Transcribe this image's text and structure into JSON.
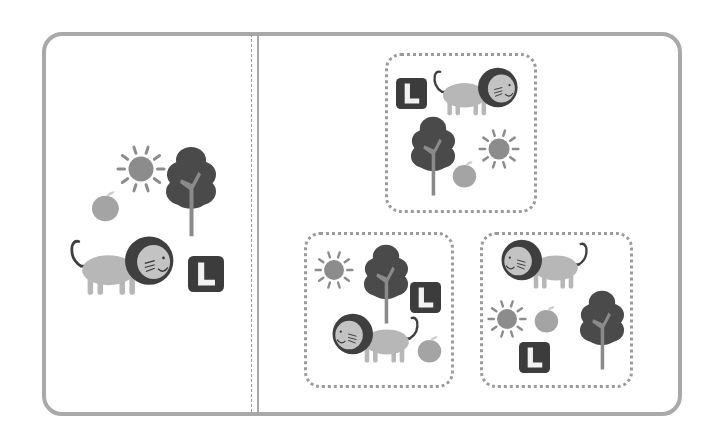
{
  "puzzle": {
    "type": "picture-matching",
    "colors": {
      "frame": "#a9a9a9",
      "dotted_border": "#9b9b9b",
      "lion_body": "#b7b7b7",
      "lion_mane": "#3f3f3f",
      "lion_face": "#c3c3c3",
      "tree_foliage": "#4a4a4a",
      "tree_trunk": "#8a8a8a",
      "sun": "#8c8c8c",
      "apple": "#a4a4a4",
      "letter_tile": "#3c3c3c",
      "letter_fill": "#f2f2f2"
    },
    "reference_panel": {
      "items": [
        {
          "kind": "sun",
          "x": 116,
          "y": 144,
          "size": 50
        },
        {
          "kind": "tree",
          "x": 166,
          "y": 146,
          "size": 50
        },
        {
          "kind": "apple",
          "x": 90,
          "y": 190,
          "size": 32
        },
        {
          "kind": "lion",
          "x": 70,
          "y": 232,
          "size": 110,
          "facing": "right"
        },
        {
          "kind": "letter-tile",
          "x": 188,
          "y": 256,
          "size": 36,
          "letter": "L"
        }
      ]
    },
    "options": [
      {
        "id": "top",
        "box": {
          "x": 385,
          "y": 53,
          "w": 152,
          "h": 160
        },
        "items": [
          {
            "kind": "letter-tile",
            "x": 396,
            "y": 78,
            "size": 31,
            "letter": "L"
          },
          {
            "kind": "lion",
            "x": 433,
            "y": 64,
            "size": 90,
            "facing": "right"
          },
          {
            "kind": "tree",
            "x": 411,
            "y": 116,
            "size": 44
          },
          {
            "kind": "sun",
            "x": 478,
            "y": 128,
            "size": 42
          },
          {
            "kind": "apple",
            "x": 451,
            "y": 160,
            "size": 28
          }
        ]
      },
      {
        "id": "bottom-left",
        "box": {
          "x": 304,
          "y": 232,
          "w": 150,
          "h": 156
        },
        "items": [
          {
            "kind": "sun",
            "x": 314,
            "y": 250,
            "size": 40
          },
          {
            "kind": "tree",
            "x": 364,
            "y": 244,
            "size": 44
          },
          {
            "kind": "letter-tile",
            "x": 410,
            "y": 282,
            "size": 31,
            "letter": "L"
          },
          {
            "kind": "lion",
            "x": 327,
            "y": 310,
            "size": 92,
            "facing": "left"
          },
          {
            "kind": "apple",
            "x": 416,
            "y": 335,
            "size": 28
          }
        ]
      },
      {
        "id": "bottom-right",
        "box": {
          "x": 480,
          "y": 232,
          "w": 153,
          "h": 156
        },
        "items": [
          {
            "kind": "lion",
            "x": 496,
            "y": 236,
            "size": 92,
            "facing": "left"
          },
          {
            "kind": "sun",
            "x": 487,
            "y": 299,
            "size": 40
          },
          {
            "kind": "apple",
            "x": 533,
            "y": 305,
            "size": 28
          },
          {
            "kind": "tree",
            "x": 580,
            "y": 290,
            "size": 44
          },
          {
            "kind": "letter-tile",
            "x": 519,
            "y": 342,
            "size": 31,
            "letter": "L"
          }
        ]
      }
    ]
  }
}
